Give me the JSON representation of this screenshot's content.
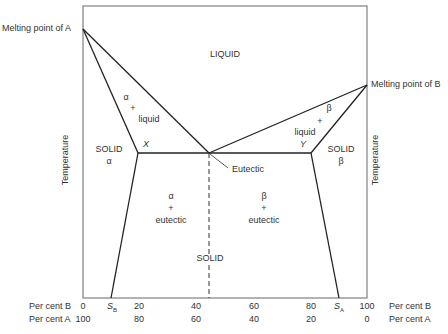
{
  "diagram": {
    "labels": {
      "melting_a": "Melting point of A",
      "melting_b": "Melting point of B",
      "liquid": "LIQUID",
      "alpha_liquid": [
        "α",
        "+",
        "liquid"
      ],
      "beta_liquid": [
        "β",
        "+",
        "liquid"
      ],
      "solid_alpha": [
        "SOLID",
        "α"
      ],
      "solid_beta": [
        "SOLID",
        "β"
      ],
      "x_point": "X",
      "y_point": "Y",
      "eutectic": "Eutectic",
      "alpha_eutectic": [
        "α",
        "+",
        "eutectic"
      ],
      "beta_eutectic": [
        "β",
        "+",
        "eutectic"
      ],
      "solid": "SOLID",
      "y_axis_left": "Temperature",
      "y_axis_right": "Temperature"
    },
    "axis": {
      "row_b_label": "Per cent B",
      "row_a_label": "Per cent A",
      "b_ticks": [
        "0",
        "20",
        "40",
        "60",
        "80",
        "100"
      ],
      "a_ticks": [
        "100",
        "80",
        "60",
        "40",
        "20",
        "0"
      ],
      "sb": "S",
      "sb_sub": "B",
      "sa": "S",
      "sa_sub": "A"
    },
    "colors": {
      "line": "#222222",
      "frame": "#555555",
      "text": "#333333"
    }
  }
}
